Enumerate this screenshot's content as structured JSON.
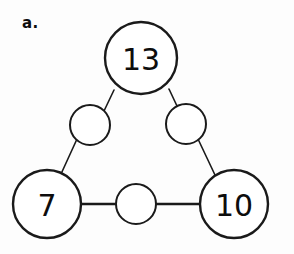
{
  "figure": {
    "label": "a.",
    "type": "number-triangle-puzzle",
    "background_color": "#fdfdfd",
    "stroke_color": "#1a1a1a",
    "fill_color": "#ffffff"
  },
  "nodes": {
    "corner_top": {
      "name": "top-corner-node",
      "value": "13",
      "cx": 141,
      "cy": 58,
      "r": 36,
      "filled": true,
      "font_size": 30
    },
    "corner_bottom_left": {
      "name": "bottom-left-corner-node",
      "value": "7",
      "cx": 47,
      "cy": 204,
      "r": 34,
      "filled": true,
      "font_size": 30
    },
    "corner_bottom_right": {
      "name": "bottom-right-corner-node",
      "value": "10",
      "cx": 234,
      "cy": 204,
      "r": 34,
      "filled": true,
      "font_size": 30
    },
    "mid_left": {
      "name": "left-midpoint-node",
      "value": "",
      "cx": 90,
      "cy": 125,
      "r": 20,
      "filled": false,
      "font_size": 18
    },
    "mid_right": {
      "name": "right-midpoint-node",
      "value": "",
      "cx": 186,
      "cy": 124,
      "r": 20,
      "filled": false,
      "font_size": 18
    },
    "mid_bottom": {
      "name": "bottom-midpoint-node",
      "value": "",
      "cx": 136,
      "cy": 204,
      "r": 20,
      "filled": false,
      "font_size": 18
    }
  },
  "edges": [
    {
      "name": "edge-top-to-left-mid",
      "x1": 114,
      "y1": 90,
      "x2": 104,
      "y2": 111,
      "width": 1.6
    },
    {
      "name": "edge-left-mid-to-bottom-left",
      "x1": 77,
      "y1": 139,
      "x2": 61,
      "y2": 174,
      "width": 1.6
    },
    {
      "name": "edge-top-to-right-mid",
      "x1": 169,
      "y1": 89,
      "x2": 177,
      "y2": 106,
      "width": 1.6
    },
    {
      "name": "edge-right-mid-to-bottom-right",
      "x1": 198,
      "y1": 139,
      "x2": 215,
      "y2": 175,
      "width": 1.6
    },
    {
      "name": "edge-bottom-left-to-bottom-mid",
      "x1": 81,
      "y1": 204,
      "x2": 116,
      "y2": 204,
      "width": 2.6
    },
    {
      "name": "edge-bottom-mid-to-bottom-right",
      "x1": 156,
      "y1": 204,
      "x2": 200,
      "y2": 204,
      "width": 2.6
    }
  ]
}
